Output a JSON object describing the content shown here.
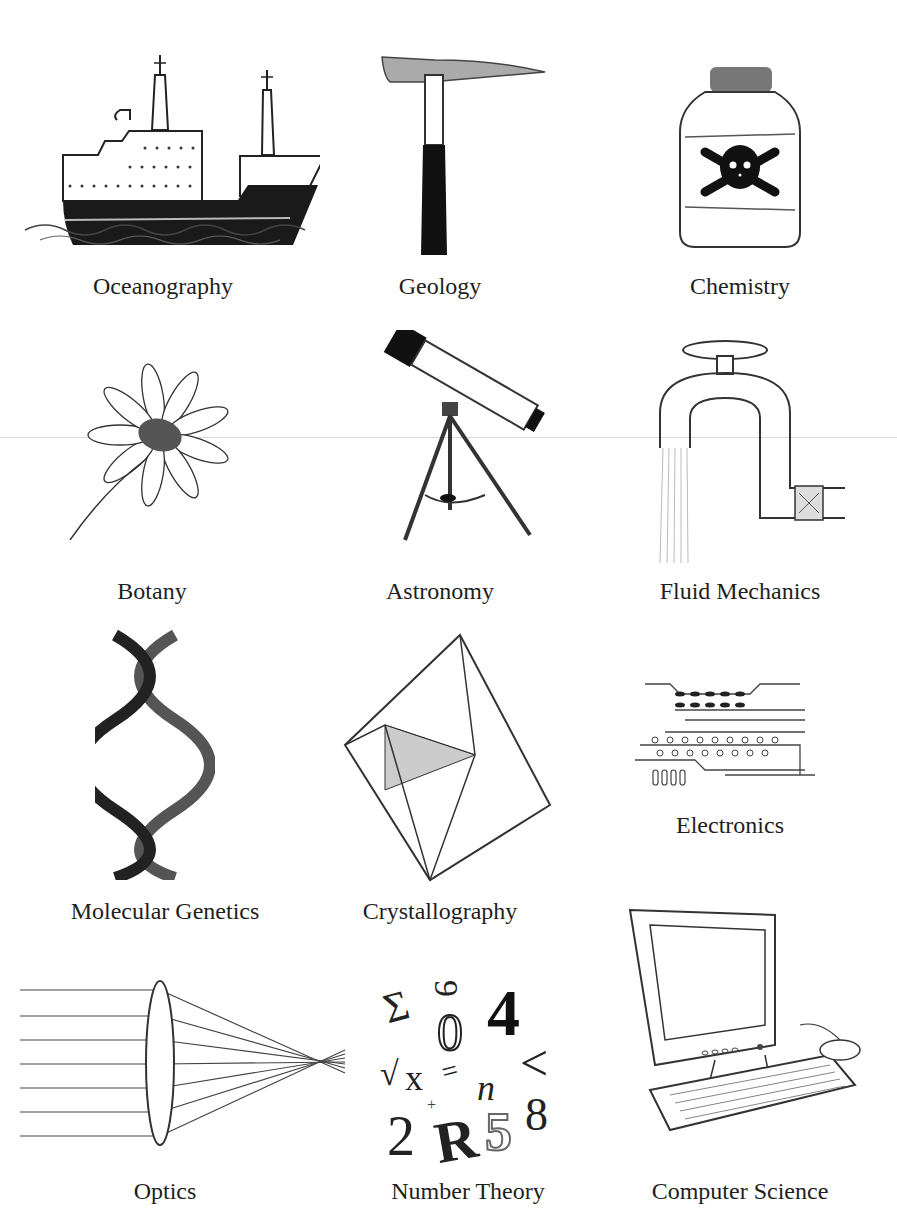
{
  "page": {
    "grid": {
      "rows": 4,
      "cols": 3
    }
  },
  "items": [
    {
      "label": "Oceanography",
      "icon": "ship-icon"
    },
    {
      "label": "Geology",
      "icon": "rock-hammer-icon"
    },
    {
      "label": "Chemistry",
      "icon": "poison-bottle-icon"
    },
    {
      "label": "Botany",
      "icon": "daisy-flower-icon"
    },
    {
      "label": "Astronomy",
      "icon": "telescope-icon"
    },
    {
      "label": "Fluid Mechanics",
      "icon": "water-faucet-icon"
    },
    {
      "label": "Molecular Genetics",
      "icon": "dna-helix-icon"
    },
    {
      "label": "Crystallography",
      "icon": "crystal-icon"
    },
    {
      "label": "Electronics",
      "icon": "circuit-board-icon"
    },
    {
      "label": "Optics",
      "icon": "lens-icon"
    },
    {
      "label": "Number Theory",
      "icon": "numbers-symbols-icon"
    },
    {
      "label": "Computer Science",
      "icon": "computer-icon"
    }
  ],
  "number_theory_glyphs": [
    "Σ",
    "9",
    "0",
    "4",
    "√",
    "x",
    "=",
    "n",
    "<",
    "+",
    "2",
    "R",
    "5",
    "8"
  ]
}
